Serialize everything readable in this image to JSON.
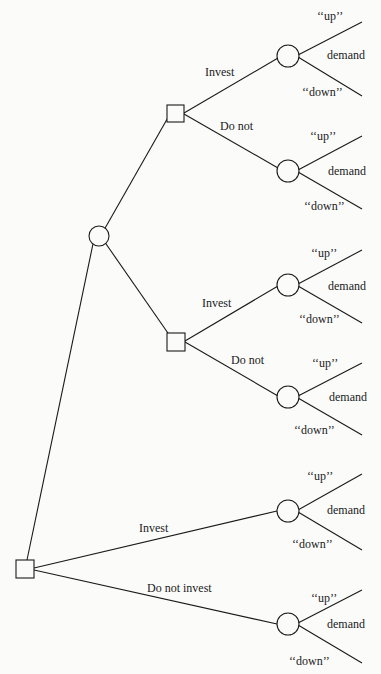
{
  "tree": {
    "root_branches": {
      "invest": "Invest",
      "do_not_invest": "Do not invest"
    },
    "sub_upper": {
      "invest": "Invest",
      "do_not": "Do not"
    },
    "sub_lower": {
      "invest": "Invest",
      "do_not": "Do not"
    },
    "outcome": {
      "up": "‘‘up’’",
      "demand": "demand",
      "down": "‘‘down’’"
    }
  }
}
